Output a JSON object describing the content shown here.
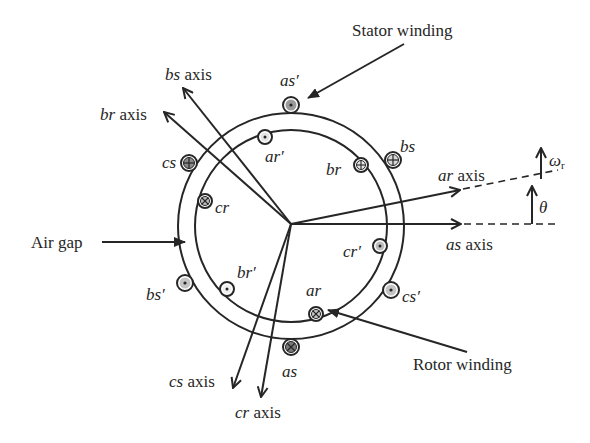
{
  "diagram": {
    "callouts": {
      "stator_winding": "Stator winding",
      "rotor_winding": "Rotor winding",
      "air_gap": "Air gap"
    },
    "axes": {
      "as": {
        "name": "as",
        "suffix": " axis"
      },
      "bs": {
        "name": "bs",
        "suffix": " axis"
      },
      "cs": {
        "name": "cs",
        "suffix": " axis"
      },
      "ar": {
        "name": "ar",
        "suffix": " axis"
      },
      "br": {
        "name": "br",
        "suffix": " axis"
      },
      "cr": {
        "name": "cr",
        "suffix": " axis"
      }
    },
    "stator_slots": {
      "as": "as",
      "as_prime": "as′",
      "bs": "bs",
      "bs_prime": "bs′",
      "cs": "cs",
      "cs_prime": "cs′"
    },
    "rotor_slots": {
      "ar": "ar",
      "ar_prime": "ar′",
      "br": "br",
      "br_prime": "br′",
      "cr": "cr",
      "cr_prime": "cr′"
    },
    "angle": {
      "theta": "θ",
      "omega": "ω",
      "omega_sub": "r"
    },
    "colors": {
      "line": "#262626",
      "slot_fill": "#9a9a9a",
      "slot_light": "#d8d8d8"
    }
  }
}
